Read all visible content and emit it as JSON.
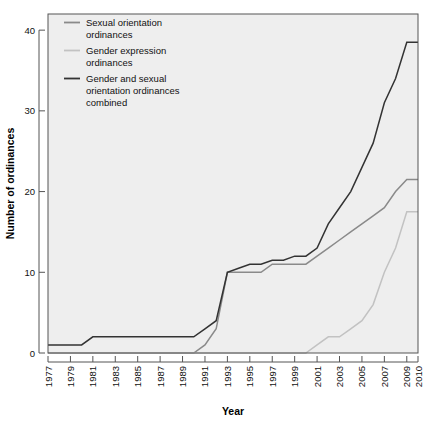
{
  "chart_data": {
    "type": "line",
    "title": "",
    "xlabel": "Year",
    "ylabel": "Number of ordinances",
    "xlim": [
      1977,
      2010
    ],
    "ylim": [
      0,
      42
    ],
    "yticks": [
      0,
      10,
      20,
      30,
      40
    ],
    "ytick_labels": [
      "0",
      "10",
      "20",
      "30",
      "40"
    ],
    "xticks": [
      1977,
      1979,
      1981,
      1983,
      1985,
      1987,
      1989,
      1991,
      1993,
      1995,
      1997,
      1999,
      2001,
      2003,
      2005,
      2007,
      2009,
      2010
    ],
    "xtick_labels": [
      "1977",
      "1979",
      "1981",
      "1983",
      "1985",
      "1987",
      "1989",
      "1991",
      "1993",
      "1995",
      "1997",
      "1999",
      "2001",
      "2003",
      "2005",
      "2007",
      "2009",
      "2010"
    ],
    "grid": false,
    "legend_position": "top-left",
    "x": [
      1977,
      1978,
      1979,
      1980,
      1981,
      1982,
      1983,
      1984,
      1985,
      1986,
      1987,
      1988,
      1989,
      1990,
      1991,
      1992,
      1993,
      1994,
      1995,
      1996,
      1997,
      1998,
      1999,
      2000,
      2001,
      2002,
      2003,
      2004,
      2005,
      2006,
      2007,
      2008,
      2009,
      2010
    ],
    "series": [
      {
        "name": "Sexual orientation ordinances",
        "color": "#8a8a8a",
        "values": [
          0,
          0,
          0,
          0,
          0,
          0,
          0,
          0,
          0,
          0,
          0,
          0,
          0,
          0,
          1,
          3,
          10,
          10,
          10,
          10,
          11,
          11,
          11,
          11,
          12,
          13,
          14,
          15,
          16,
          17,
          18,
          20,
          21.5,
          21.5
        ]
      },
      {
        "name": "Gender expression ordinances",
        "color": "#c2c2c2",
        "values": [
          0,
          0,
          0,
          0,
          0,
          0,
          0,
          0,
          0,
          0,
          0,
          0,
          0,
          0,
          0,
          0,
          0,
          0,
          0,
          0,
          0,
          0,
          0,
          0,
          1,
          2,
          2,
          3,
          4,
          6,
          10,
          13,
          17.5,
          17.5
        ]
      },
      {
        "name": "Gender and sexual orientation ordinances combined",
        "color": "#333333",
        "values": [
          1,
          1,
          1,
          1,
          2,
          2,
          2,
          2,
          2,
          2,
          2,
          2,
          2,
          2,
          3,
          4,
          10,
          10.5,
          11,
          11,
          11.5,
          11.5,
          12,
          12,
          13,
          16,
          18,
          20,
          23,
          26,
          31,
          34,
          38.5,
          38.5
        ]
      }
    ],
    "legend": [
      {
        "label_line1": "Sexual orientation",
        "label_line2": "ordinances",
        "label_line3": "",
        "color": "#8a8a8a"
      },
      {
        "label_line1": "Gender expression",
        "label_line2": "ordinances",
        "label_line3": "",
        "color": "#c2c2c2"
      },
      {
        "label_line1": "Gender and sexual",
        "label_line2": "orientation ordinances",
        "label_line3": "combined",
        "color": "#333333"
      }
    ]
  }
}
